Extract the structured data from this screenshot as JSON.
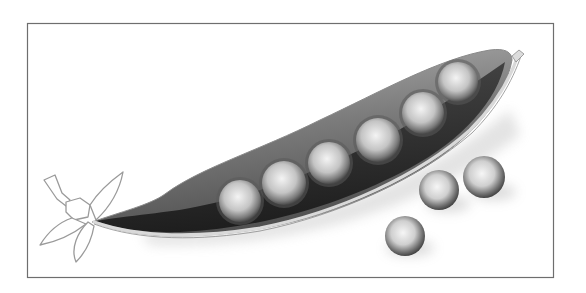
{
  "image": {
    "subject": "pea pod illustration",
    "style": "grayscale",
    "frame": {
      "x": 27,
      "y": 23,
      "width": 526,
      "height": 254,
      "stroke": "#6e6e6e"
    },
    "colors": {
      "background": "#ffffff",
      "pod_outer": "#8a8a8a",
      "pod_inner": "#2e2e2e",
      "pod_rim": "#d8d8d8",
      "pea_light": "#f2f2f2",
      "pea_dark": "#6a6a6a",
      "stem_outline": "#9a9a9a"
    },
    "pod_peas": [
      {
        "cx": 240,
        "cy": 201,
        "r": 21
      },
      {
        "cx": 284,
        "cy": 183,
        "r": 22
      },
      {
        "cx": 329,
        "cy": 163,
        "r": 21
      },
      {
        "cx": 378,
        "cy": 140,
        "r": 22
      },
      {
        "cx": 423,
        "cy": 113,
        "r": 21
      },
      {
        "cx": 458,
        "cy": 82,
        "r": 20
      }
    ],
    "loose_peas": [
      {
        "cx": 405,
        "cy": 236,
        "r": 20
      },
      {
        "cx": 439,
        "cy": 190,
        "r": 20
      },
      {
        "cx": 484,
        "cy": 177,
        "r": 21
      }
    ]
  }
}
